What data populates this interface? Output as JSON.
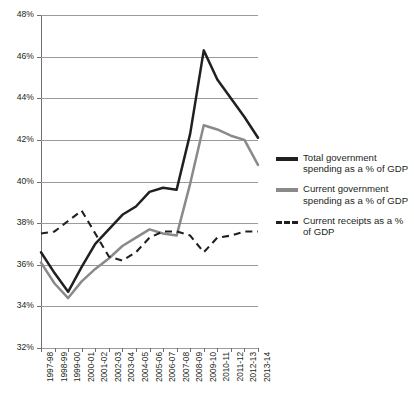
{
  "chart_data": {
    "type": "line",
    "title": "",
    "xlabel": "",
    "ylabel": "",
    "ylim": [
      32,
      48
    ],
    "ytick_step": 2,
    "grid": true,
    "legend_position": "right",
    "ytick_labels": [
      "48%",
      "46%",
      "44%",
      "42%",
      "40%",
      "38%",
      "36%",
      "34%",
      "32%"
    ],
    "ytick_values": [
      48,
      46,
      44,
      42,
      40,
      38,
      36,
      34,
      32
    ],
    "categories": [
      "1997-98",
      "1998-99",
      "1999-00",
      "2000-01",
      "2001-02",
      "2002-03",
      "2003-04",
      "2004-05",
      "2005-06",
      "2006-07",
      "2007-08",
      "2008-09",
      "2009-10",
      "2010-11",
      "2011-12",
      "2012-13",
      "2013-14"
    ],
    "series": [
      {
        "name": "Total government spending as a % of GDP",
        "style": "solid",
        "color": "#231f20",
        "values": [
          36.6,
          35.6,
          34.7,
          35.9,
          37.0,
          37.7,
          38.4,
          38.8,
          39.5,
          39.7,
          39.6,
          42.3,
          46.3,
          44.9,
          44.0,
          43.1,
          42.1
        ]
      },
      {
        "name": "Current government spending as a % of GDP",
        "style": "solid",
        "color": "#8a8a8a",
        "values": [
          36.1,
          35.1,
          34.4,
          35.2,
          35.8,
          36.3,
          36.9,
          37.3,
          37.7,
          37.5,
          37.4,
          39.9,
          42.7,
          42.5,
          42.2,
          42.0,
          40.8
        ]
      },
      {
        "name": "Current receipts as a % of GDP",
        "style": "dashed",
        "color": "#231f20",
        "values": [
          37.5,
          37.6,
          38.1,
          38.6,
          37.5,
          36.4,
          36.2,
          36.6,
          37.3,
          37.6,
          37.6,
          37.4,
          36.6,
          37.3,
          37.4,
          37.6,
          37.6
        ]
      }
    ]
  },
  "legend": {
    "items": [
      {
        "label": "Total government spending as a % of GDP",
        "swatch": "solid-black-line-swatch"
      },
      {
        "label": "Current government spending as a % of GDP",
        "swatch": "solid-grey-line-swatch"
      },
      {
        "label": "Current receipts as a % of GDP",
        "swatch": "dashed-black-line-swatch"
      }
    ]
  },
  "colors": {
    "total": "#231f20",
    "current": "#8a8a8a",
    "receipts": "#231f20",
    "grid": "#9a9a9a",
    "axis": "#6f6f6f",
    "background": "#ffffff"
  }
}
